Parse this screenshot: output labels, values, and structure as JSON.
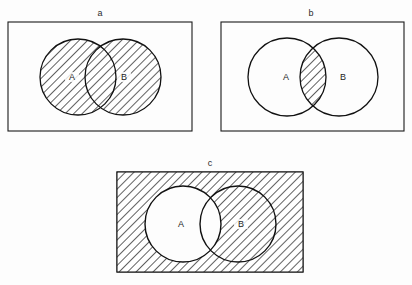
{
  "figure": {
    "type": "venn-diagram-set",
    "background_color": "#fdfdfd",
    "line_color": "#1a1a1a",
    "hatch_color": "#333333",
    "hatch_angle_deg": 45,
    "panels": [
      {
        "id": "a",
        "label": "a",
        "label_x": 100,
        "label_y": 8,
        "rect": {
          "x": 8,
          "y": 22,
          "w": 184,
          "h": 109
        },
        "circles": [
          {
            "set": "A",
            "cx": 78,
            "cy": 77,
            "r": 38,
            "label_x": 72,
            "label_y": 72
          },
          {
            "set": "B",
            "cx": 123,
            "cy": 77,
            "r": 38,
            "label_x": 124,
            "label_y": 72
          }
        ],
        "shaded_region": "union",
        "shaded_description": "A union B",
        "set_labels": [
          "A",
          "B"
        ]
      },
      {
        "id": "b",
        "label": "b",
        "label_x": 311,
        "label_y": 8,
        "rect": {
          "x": 221,
          "y": 22,
          "w": 183,
          "h": 109
        },
        "circles": [
          {
            "set": "A",
            "cx": 287,
            "cy": 77,
            "r": 39,
            "label_x": 286,
            "label_y": 72
          },
          {
            "set": "B",
            "cx": 339,
            "cy": 77,
            "r": 39,
            "label_x": 343,
            "label_y": 72
          }
        ],
        "shaded_region": "intersection",
        "shaded_description": "A intersect B",
        "set_labels": [
          "A",
          "B"
        ]
      },
      {
        "id": "c",
        "label": "c",
        "label_x": 210,
        "label_y": 158,
        "rect": {
          "x": 117,
          "y": 172,
          "w": 186,
          "h": 100
        },
        "circles": [
          {
            "set": "A",
            "cx": 183,
            "cy": 224,
            "r": 38,
            "label_x": 181,
            "label_y": 219
          },
          {
            "set": "B",
            "cx": 238,
            "cy": 224,
            "r": 38,
            "label_x": 241,
            "label_y": 219
          }
        ],
        "shaded_region": "complement-of-A",
        "shaded_description": "complement of A",
        "set_labels": [
          "A",
          "B"
        ]
      }
    ]
  }
}
